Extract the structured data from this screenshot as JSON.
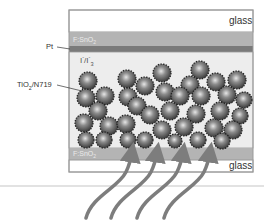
{
  "diagram": {
    "title": "",
    "layers": [
      {
        "id": "top-glass",
        "label": "glass"
      },
      {
        "id": "top-fto",
        "label": "F:SnO",
        "label_sub": "2"
      },
      {
        "id": "pt",
        "label": "Pt"
      },
      {
        "id": "electrolyte",
        "label": "I",
        "label_sup": "-",
        "label2": "/I",
        "label2_sub": "3",
        "label2_sup": "-"
      },
      {
        "id": "tio2",
        "label": "TiO",
        "label_sub": "2",
        "label_rest": "/N719"
      },
      {
        "id": "bottom-fto",
        "label": "F:SnO",
        "label_sub": "2"
      },
      {
        "id": "bottom-glass",
        "label": "glass"
      }
    ],
    "light_arrows_count": 4,
    "colors": {
      "glass": "#ffffff",
      "fto": "#b4b4b4",
      "pt": "#7a7a7a",
      "electrolyte": "#ededed",
      "particle": "#6a6a6a",
      "arrow": "#7d7d7d",
      "border": "#9a9a9a"
    }
  }
}
